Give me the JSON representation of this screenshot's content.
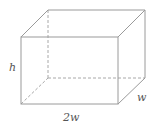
{
  "diagram": {
    "type": "rectangular-box",
    "labels": {
      "height": "h",
      "depth": "w",
      "width": "2w"
    },
    "colors": {
      "edge": "#9a9a9a",
      "hidden_edge": "#a8a8a8",
      "label": "#555555"
    }
  }
}
